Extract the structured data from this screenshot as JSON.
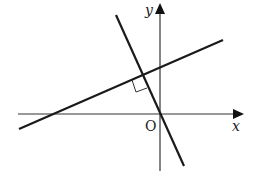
{
  "diagram": {
    "type": "coordinate-geometry",
    "axes": {
      "x_label": "x",
      "y_label": "y",
      "origin_label": "O"
    },
    "lines": [
      {
        "name": "line-1",
        "slope_sign": "positive",
        "through_origin": false
      },
      {
        "name": "line-2",
        "slope_sign": "negative",
        "through_origin": true
      }
    ],
    "markers": {
      "right_angle": "at intersection of line-1 and line-2"
    },
    "colors": {
      "stroke": "#1a1a1a",
      "axis": "#333333",
      "background": "#ffffff"
    }
  }
}
